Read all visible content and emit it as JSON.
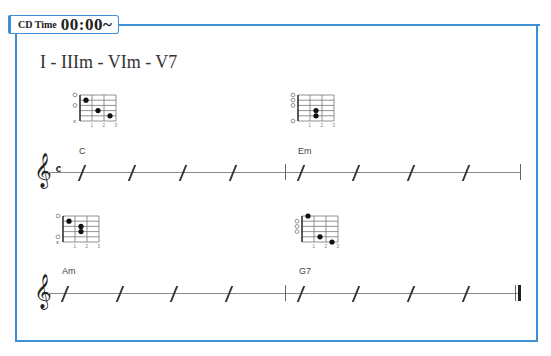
{
  "header": {
    "cd_label_small": "CD Time",
    "cd_time": "00:00~"
  },
  "progression": "I - IIIm - VIm - V7",
  "colors": {
    "frame": "#3d8fd6"
  },
  "rows": [
    {
      "time_signature": "c",
      "measures": [
        {
          "chord": "C",
          "beats": 4
        },
        {
          "chord": "Em",
          "beats": 4
        }
      ],
      "end_bar": "single"
    },
    {
      "time_signature": "",
      "measures": [
        {
          "chord": "Am",
          "beats": 4
        },
        {
          "chord": "G7",
          "beats": 4
        }
      ],
      "end_bar": "final"
    }
  ],
  "chords": {
    "C": {
      "name": "C",
      "markers": [
        "O",
        "",
        "O",
        "",
        "",
        "X"
      ],
      "dots": [
        [
          1,
          2
        ],
        [
          2,
          4
        ],
        [
          3,
          5
        ]
      ]
    },
    "Em": {
      "name": "Em",
      "markers": [
        "O",
        "O",
        "O",
        "",
        "",
        "O"
      ],
      "dots": [
        [
          2,
          4
        ],
        [
          2,
          5
        ]
      ]
    },
    "Am": {
      "name": "Am",
      "markers": [
        "O",
        "",
        "",
        "",
        "O",
        "X"
      ],
      "dots": [
        [
          1,
          2
        ],
        [
          2,
          3
        ],
        [
          2,
          4
        ]
      ]
    },
    "G7": {
      "name": "G7",
      "markers": [
        "",
        "O",
        "O",
        "O",
        "",
        ""
      ],
      "dots": [
        [
          1,
          1
        ],
        [
          2,
          5
        ],
        [
          3,
          6
        ]
      ]
    }
  },
  "fret_numbers": [
    "1",
    "2",
    "3"
  ],
  "clef_icon": "treble-clef-icon"
}
